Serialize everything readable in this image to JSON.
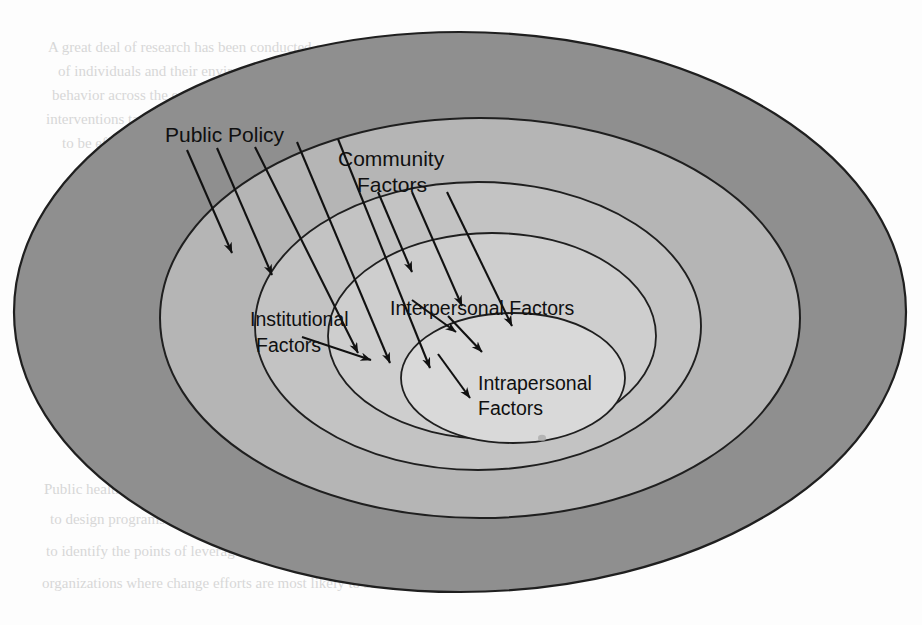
{
  "figure": {
    "type": "nested-ellipse-ecological-model",
    "background_color": "#fdfdfd",
    "outline_color": "#1a1a1a"
  },
  "rings": [
    {
      "id": "public-policy",
      "label": "Public Policy",
      "label_lines": [
        "Public Policy"
      ],
      "fill": "#8f8f8f",
      "level": 1
    },
    {
      "id": "community",
      "label": "Community Factors",
      "label_lines": [
        "Community",
        "Factors"
      ],
      "fill": "#b5b5b5",
      "level": 2
    },
    {
      "id": "institutional",
      "label": "Institutional Factors",
      "label_lines": [
        "Institutional",
        "Factors"
      ],
      "fill": "#c2c2c2",
      "level": 3
    },
    {
      "id": "interpersonal",
      "label": "Interpersonal Factors",
      "label_lines": [
        "Interpersonal Factors"
      ],
      "fill": "#cdcdcd",
      "level": 4
    },
    {
      "id": "intrapersonal",
      "label": "Intrapersonal Factors",
      "label_lines": [
        "Intrapersonal",
        "Factors"
      ],
      "fill": "#d8d8d8",
      "level": 5
    }
  ],
  "labels": {
    "public_policy": "Public Policy",
    "community_line1": "Community",
    "community_line2": "Factors",
    "institutional_line1": "Institutional",
    "institutional_line2": "Factors",
    "interpersonal": "Interpersonal Factors",
    "intrapersonal_line1": "Intrapersonal",
    "intrapersonal_line2": "Factors"
  },
  "arrows": {
    "count": 12,
    "direction": "inward",
    "description": "Fan of straight arrows pointing from outer rings toward the center",
    "color": "#111111"
  },
  "bleed_through_text": {
    "description": "Faint show-through text from the reverse side of the printed page",
    "lines": [
      "A great deal of research has been conducted on the characteristics",
      "of individuals and their environments that influence",
      "behavior across the ecological levels. The model suggests that",
      "interventions targeting multiple levels of influence are more likely",
      "to be effective than those that address only one level of the system.",
      "Public health practitioners can use the ecological perspective",
      "to design programs that operate at several levels at once, and",
      "to identify the points of leverage within communities and",
      "organizations where change efforts are most likely to succeed."
    ]
  }
}
